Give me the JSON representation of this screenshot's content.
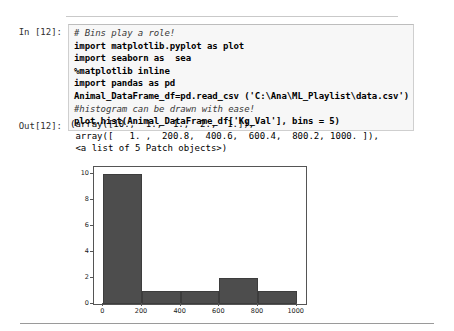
{
  "notebook": {
    "input": {
      "prompt_label": "In [12]:",
      "code_lines": [
        {
          "text": "# Bins play a role!",
          "comment": true
        },
        {
          "text": "import matplotlib.pyplot as plot",
          "comment": false
        },
        {
          "text": "import seaborn as  sea",
          "comment": false
        },
        {
          "text": "%matplotlib inline",
          "comment": false
        },
        {
          "text": "import pandas as pd",
          "comment": false
        },
        {
          "text": "Animal_DataFrame_df=pd.read_csv ('C:\\Ana\\ML_Playlist\\data.csv')",
          "comment": false
        },
        {
          "text": "#histogram can be drawn with ease!",
          "comment": true
        },
        {
          "text": "plot.hist(Animal_DataFrame_df['Kg_Val'], bins = 5)",
          "comment": false
        }
      ]
    },
    "output": {
      "prompt_label": "Out[12]:",
      "lines": [
        "(array([10.,  1.,  1.,  2.,  1.]),",
        " array([   1. ,  200.8,  400.6,  600.4,  800.2, 1000. ]),",
        " <a list of 5 Patch objects>)"
      ]
    }
  },
  "chart_data": {
    "type": "bar",
    "title": "",
    "xlabel": "",
    "ylabel": "",
    "grid": false,
    "legend": null,
    "bin_edges": [
      1.0,
      200.8,
      400.6,
      600.4,
      800.2,
      1000.0
    ],
    "values": [
      10,
      1,
      1,
      2,
      1
    ],
    "categories": [
      "1.0-200.8",
      "200.8-400.6",
      "400.6-600.4",
      "600.4-800.2",
      "800.2-1000.0"
    ],
    "xlim": [
      -48,
      1048
    ],
    "ylim": [
      0,
      10.5
    ],
    "xticks": [
      0,
      200,
      400,
      600,
      800,
      1000
    ],
    "xtick_labels": [
      "0",
      "200",
      "400",
      "600",
      "800",
      "1000"
    ],
    "yticks": [
      0,
      2,
      4,
      6,
      8,
      10
    ],
    "ytick_labels": [
      "0",
      "2",
      "4",
      "6",
      "8",
      "10"
    ],
    "bar_color": "#4d4d4d"
  }
}
